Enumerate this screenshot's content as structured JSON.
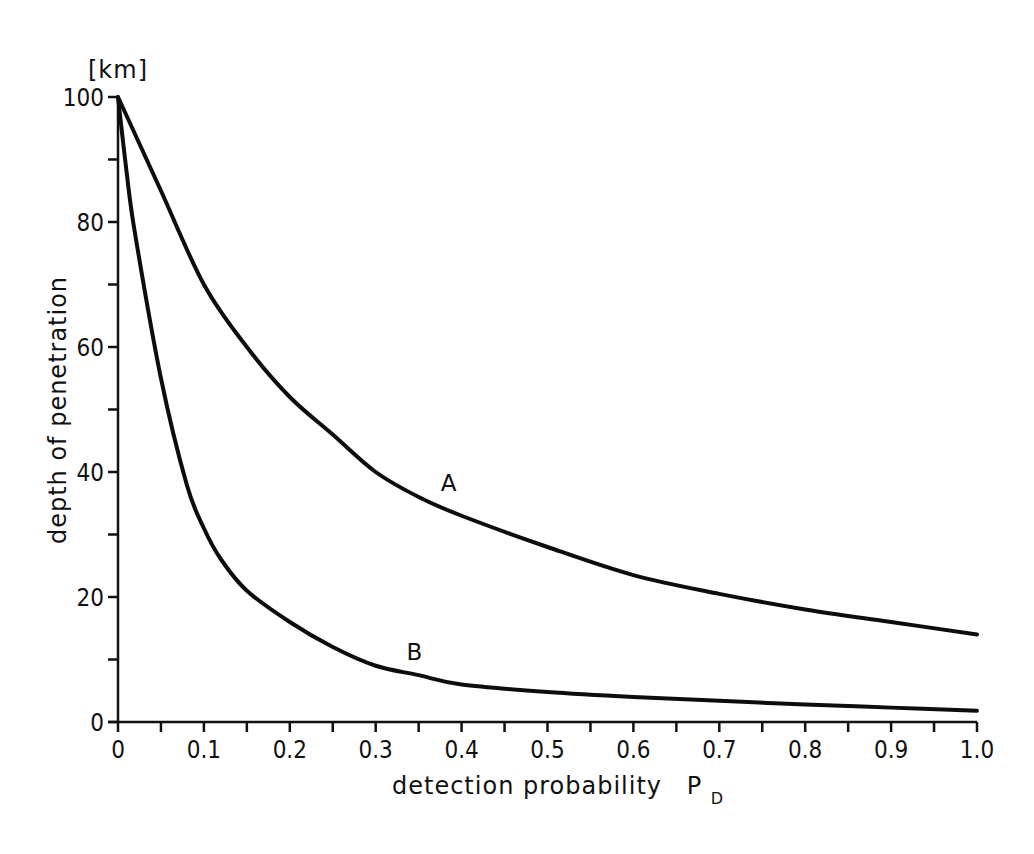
{
  "chart_data": {
    "type": "line",
    "title": "",
    "xlabel": "detection probability P_D",
    "xlabel_main": "detection probability",
    "xlabel_symbol": "P",
    "xlabel_subscript": "D",
    "ylabel": "depth of penetration",
    "yunit": "[km]",
    "xlim": [
      0,
      1.0
    ],
    "ylim": [
      0,
      100
    ],
    "grid": false,
    "legend": "none (curves labelled inline)",
    "x_ticks": [
      "0",
      "0.1",
      "0.2",
      "0.3",
      "0.4",
      "0.5",
      "0.6",
      "0.7",
      "0.8",
      "0.9",
      "1.0"
    ],
    "x_minor_ticks": [
      0.05,
      0.15,
      0.25,
      0.35,
      0.45,
      0.55,
      0.65,
      0.75,
      0.85,
      0.95
    ],
    "y_ticks": [
      "0",
      "20",
      "40",
      "60",
      "80",
      "100"
    ],
    "y_minor_ticks": [
      10,
      30,
      50,
      70,
      90
    ],
    "series": [
      {
        "name": "A",
        "label_position": {
          "x": 0.385,
          "y": 37
        },
        "x": [
          0,
          0.02,
          0.05,
          0.1,
          0.15,
          0.2,
          0.25,
          0.3,
          0.35,
          0.4,
          0.5,
          0.6,
          0.7,
          0.8,
          0.9,
          1.0
        ],
        "y": [
          100,
          94,
          85,
          70,
          60,
          52,
          46,
          40,
          36,
          33,
          28,
          23.5,
          20.5,
          18,
          16,
          14
        ]
      },
      {
        "name": "B",
        "label_position": {
          "x": 0.345,
          "y": 10
        },
        "x": [
          0,
          0.01,
          0.02,
          0.05,
          0.08,
          0.1,
          0.12,
          0.15,
          0.2,
          0.25,
          0.3,
          0.35,
          0.4,
          0.5,
          0.6,
          0.7,
          0.8,
          0.9,
          1.0
        ],
        "y": [
          100,
          88,
          78,
          55,
          38,
          31,
          26,
          21,
          16,
          12,
          9,
          7.5,
          6,
          4.8,
          4,
          3.4,
          2.8,
          2.3,
          1.8
        ]
      }
    ]
  }
}
